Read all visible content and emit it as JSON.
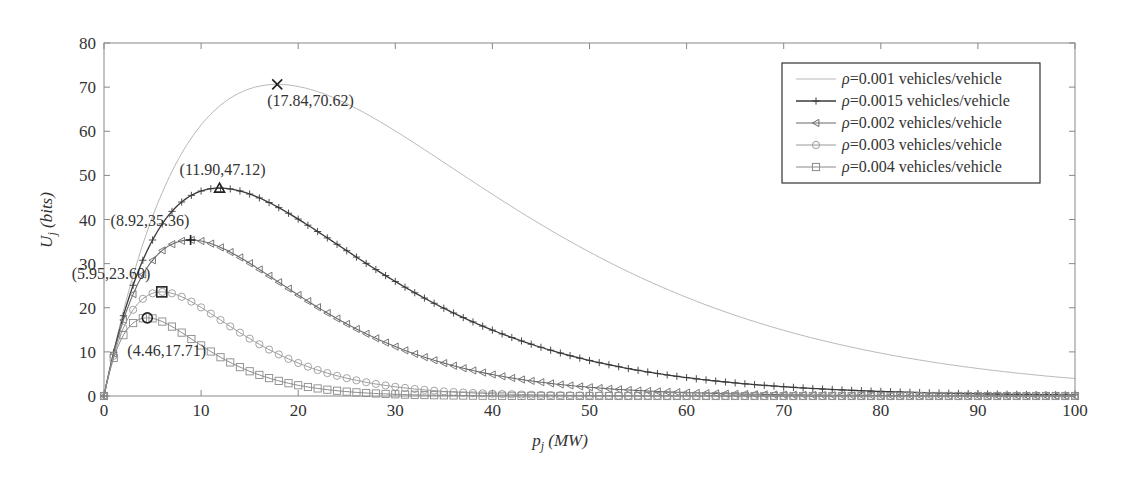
{
  "chart_data": {
    "type": "line",
    "title": "",
    "xlabel": "p_j (MW)",
    "ylabel": "U_j (bits)",
    "xlim": [
      0,
      100
    ],
    "ylim": [
      0,
      80
    ],
    "xticks": [
      0,
      10,
      20,
      30,
      40,
      50,
      60,
      70,
      80,
      90,
      100
    ],
    "yticks": [
      0,
      10,
      20,
      30,
      40,
      50,
      60,
      70,
      80
    ],
    "grid": false,
    "legend_position": "upper right",
    "model_note": "U = Umax*(p/p_peak)*exp(1 - p/p_peak), sampled at p = 0..100 step 1",
    "series": [
      {
        "name": "ρ=0.001 vehicles/vehicle",
        "rho": "0.001",
        "peak": [
          17.84,
          70.62
        ],
        "peak_marker": "x",
        "marker": "none",
        "color": "#b8b8b8",
        "width": 1.0
      },
      {
        "name": "ρ=0.0015 vehicles/vehicle",
        "rho": "0.0015",
        "peak": [
          11.9,
          47.12
        ],
        "peak_marker": "triangle",
        "marker": "plus",
        "color": "#3a3a3a",
        "width": 1.3
      },
      {
        "name": "ρ=0.002 vehicles/vehicle",
        "rho": "0.002",
        "peak": [
          8.92,
          35.36
        ],
        "peak_marker": "plus",
        "marker": "triangle-left",
        "color": "#6a6a6a",
        "width": 1.1
      },
      {
        "name": "ρ=0.003 vehicles/vehicle",
        "rho": "0.003",
        "peak": [
          5.95,
          23.6
        ],
        "peak_marker": "square",
        "marker": "circle",
        "color": "#9a9a9a",
        "width": 1.0
      },
      {
        "name": "ρ=0.004 vehicles/vehicle",
        "rho": "0.004",
        "peak": [
          4.46,
          17.71
        ],
        "peak_marker": "circle",
        "marker": "square",
        "color": "#8a8a8a",
        "width": 1.0
      }
    ],
    "annotations": [
      {
        "text": "(17.84,70.62)",
        "x": 17.84,
        "y": 70.62
      },
      {
        "text": "(11.90,47.12)",
        "x": 11.9,
        "y": 47.12
      },
      {
        "text": "(8.92,35.36)",
        "x": 8.92,
        "y": 35.36
      },
      {
        "text": "(5.95,23.60)",
        "x": 5.95,
        "y": 23.6
      },
      {
        "text": "(4.46,17.71)",
        "x": 4.46,
        "y": 17.71
      }
    ]
  },
  "labels": {
    "xlabel_main": "p",
    "xlabel_sub": "j",
    "xlabel_unit": "(MW)",
    "ylabel_main": "U",
    "ylabel_sub": "j",
    "ylabel_unit": "(bits)",
    "rho_symbol": "ρ"
  },
  "legend": [
    {
      "rho_value": "=0.001 vehicles/vehicle"
    },
    {
      "rho_value": "=0.0015 vehicles/vehicle"
    },
    {
      "rho_value": "=0.002 vehicles/vehicle"
    },
    {
      "rho_value": "=0.003 vehicles/vehicle"
    },
    {
      "rho_value": "=0.004 vehicles/vehicle"
    }
  ]
}
